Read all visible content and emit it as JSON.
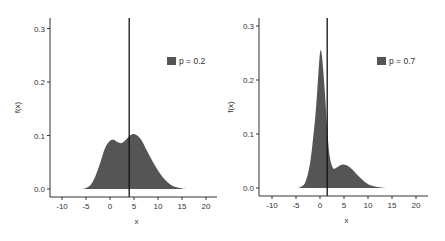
{
  "colors": {
    "fill": "#555555",
    "axis": "#333333",
    "vline": "#111111",
    "text": "#333333"
  },
  "chart_data": [
    {
      "type": "area",
      "title": "",
      "xlabel": "x",
      "ylabel": "f(x)",
      "xlim": [
        -12,
        23
      ],
      "ylim": [
        -0.015,
        0.32
      ],
      "xticks": [
        -10,
        -5,
        0,
        5,
        10,
        15,
        20
      ],
      "xtick_labels": [
        "-10",
        "-5",
        "0",
        "5",
        "10",
        "15",
        "20"
      ],
      "yticks": [
        0.0,
        0.1,
        0.2,
        0.3
      ],
      "ytick_labels": [
        "0.0",
        "0.1",
        "0.2",
        "0.3"
      ],
      "grid": false,
      "legend_position": "top-right",
      "vline": 4.0,
      "series": [
        {
          "name": "p = 0.2",
          "x": [
            -6,
            -5,
            -4,
            -3,
            -2,
            -1,
            0,
            0.8,
            1.5,
            2.5,
            3.5,
            4.5,
            5.5,
            6.5,
            7.5,
            8.5,
            9.5,
            10.5,
            11.5,
            12.5,
            13.5,
            15,
            16
          ],
          "y": [
            0,
            0.002,
            0.008,
            0.025,
            0.05,
            0.077,
            0.09,
            0.092,
            0.088,
            0.086,
            0.094,
            0.102,
            0.101,
            0.092,
            0.075,
            0.058,
            0.042,
            0.028,
            0.017,
            0.009,
            0.004,
            0.001,
            0
          ]
        }
      ]
    },
    {
      "type": "area",
      "title": "",
      "xlabel": "x",
      "ylabel": "f(x)",
      "xlim": [
        -12,
        23
      ],
      "ylim": [
        -0.015,
        0.32
      ],
      "xticks": [
        -10,
        -5,
        0,
        5,
        10,
        15,
        20
      ],
      "xtick_labels": [
        "-10",
        "-5",
        "0",
        "5",
        "10",
        "15",
        "20"
      ],
      "yticks": [
        0.0,
        0.1,
        0.2,
        0.3
      ],
      "ytick_labels": [
        "0.0",
        "0.1",
        "0.2",
        "0.3"
      ],
      "grid": false,
      "legend_position": "top-right",
      "vline": 1.5,
      "series": [
        {
          "name": "p = 0.7",
          "x": [
            -5,
            -4,
            -3,
            -2,
            -1,
            -0.5,
            0,
            0.4,
            1,
            1.5,
            2,
            2.7,
            3.5,
            4.5,
            5.5,
            6.5,
            7.5,
            8.5,
            9.5,
            10.5,
            12,
            14
          ],
          "y": [
            0,
            0.002,
            0.012,
            0.05,
            0.13,
            0.19,
            0.25,
            0.245,
            0.18,
            0.11,
            0.06,
            0.037,
            0.038,
            0.043,
            0.042,
            0.036,
            0.027,
            0.018,
            0.01,
            0.005,
            0.002,
            0
          ]
        }
      ]
    }
  ]
}
